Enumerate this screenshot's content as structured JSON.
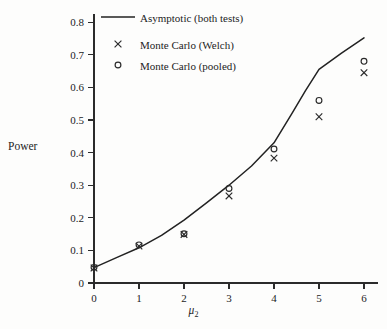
{
  "chart_data": {
    "type": "line",
    "title": "",
    "subtitle": "",
    "xlabel": "μ₂",
    "ylabel": "Power",
    "xlim": [
      0,
      6.4
    ],
    "ylim": [
      0,
      0.83
    ],
    "grid": false,
    "legend_position": "top-left",
    "xticks": [
      "0",
      "1",
      "2",
      "3",
      "4",
      "5",
      "6"
    ],
    "xtick_values": [
      0,
      1,
      2,
      3,
      4,
      5,
      6
    ],
    "yticks": [
      "0",
      "0.1",
      "0.2",
      "0.3",
      "0.4",
      "0.5",
      "0.6",
      "0.7",
      "0.8"
    ],
    "ytick_values": [
      0,
      0.1,
      0.2,
      0.3,
      0.4,
      0.5,
      0.6,
      0.7,
      0.8
    ],
    "series": [
      {
        "name": "Asymptotic (both tests)",
        "marker": "line",
        "x": [
          0,
          0.5,
          1,
          1.5,
          2,
          2.5,
          3,
          3.5,
          4,
          4.4,
          4.7,
          5,
          5.5,
          6
        ],
        "values": [
          0.047,
          0.078,
          0.108,
          0.146,
          0.193,
          0.246,
          0.3,
          0.359,
          0.43,
          0.52,
          0.59,
          0.655,
          0.705,
          0.752
        ]
      },
      {
        "name": "Monte Carlo (Welch)",
        "marker": "cross",
        "x": [
          0,
          1,
          2,
          3,
          4,
          5,
          6
        ],
        "values": [
          0.046,
          0.113,
          0.149,
          0.267,
          0.383,
          0.51,
          0.645
        ]
      },
      {
        "name": "Monte Carlo (pooled)",
        "marker": "circle",
        "x": [
          0,
          1,
          2,
          3,
          4,
          5,
          6
        ],
        "values": [
          0.048,
          0.117,
          0.151,
          0.29,
          0.411,
          0.56,
          0.68
        ]
      }
    ]
  },
  "legend": {
    "entries": [
      {
        "label": "Asymptotic (both tests)",
        "marker": "line"
      },
      {
        "label": "Monte Carlo (Welch)",
        "marker": "cross"
      },
      {
        "label": "Monte Carlo (pooled)",
        "marker": "circle"
      }
    ]
  },
  "colors": {
    "line": "#222222",
    "marker": "#2a2a2a",
    "axis": "#2b2b2b",
    "text": "#1c1c1c",
    "background": "#fdfdfc"
  }
}
